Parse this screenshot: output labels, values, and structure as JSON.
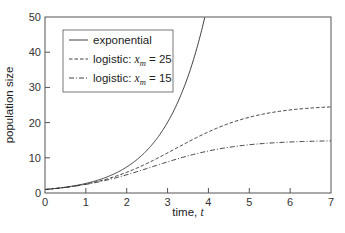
{
  "chart_data": {
    "type": "line",
    "title": "",
    "xlabel": "time, ",
    "xlabel_var": "t",
    "ylabel": "population size",
    "xlim": [
      0,
      7
    ],
    "ylim": [
      0,
      50
    ],
    "xticks": [
      0,
      1,
      2,
      3,
      4,
      5,
      6,
      7
    ],
    "yticks": [
      0,
      10,
      20,
      30,
      40,
      50
    ],
    "grid": false,
    "legend_position": "upper left",
    "series": [
      {
        "name": "exponential",
        "style": "solid",
        "x": [
          0,
          0.5,
          1,
          1.5,
          2,
          2.5,
          3,
          3.5,
          3.91
        ],
        "values": [
          1.0,
          1.65,
          2.72,
          4.48,
          7.39,
          12.18,
          20.09,
          33.12,
          50.0
        ]
      },
      {
        "name": "logistic: x_m = 25",
        "style": "dashed",
        "x": [
          0,
          1,
          2,
          3,
          4,
          5,
          6,
          7
        ],
        "values": [
          1.0,
          2.55,
          5.9,
          11.05,
          16.54,
          20.55,
          22.96,
          24.46
        ]
      },
      {
        "name": "logistic: x_m = 15",
        "style": "dashdot",
        "x": [
          0,
          1,
          2,
          3,
          4,
          5,
          6,
          7
        ],
        "values": [
          1.0,
          2.45,
          5.06,
          8.59,
          11.58,
          13.37,
          14.25,
          14.81
        ]
      }
    ],
    "model": {
      "x0": 1,
      "r": 1
    }
  },
  "legend": {
    "items": [
      {
        "prefix": "exponential",
        "var": "",
        "suffix": ""
      },
      {
        "prefix": "logistic:  ",
        "var": "x",
        "sub": "m",
        "suffix": " = 25"
      },
      {
        "prefix": "logistic:  ",
        "var": "x",
        "sub": "m",
        "suffix": " = 15"
      }
    ]
  },
  "colors": {
    "line": "#2b2b2b",
    "frame": "#555555",
    "text": "#222222"
  }
}
